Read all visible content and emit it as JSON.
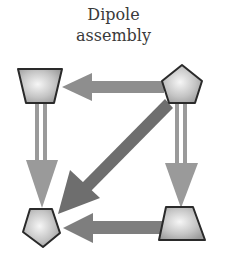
{
  "title": {
    "line1": "Dipole",
    "line2": "assembly"
  },
  "colors": {
    "arrow_light": "#9a9a9a",
    "arrow_dark": "#6e6e6e",
    "node_stroke": "#2a2a2a",
    "node_fill_center": "#f4f4f4",
    "node_fill_edge": "#9c9c9c"
  },
  "nodes": [
    {
      "id": "top-left",
      "shape": "trapezoid-inverted"
    },
    {
      "id": "top-right",
      "shape": "pentagon"
    },
    {
      "id": "bottom-left",
      "shape": "pentagon-inverted"
    },
    {
      "id": "bottom-right",
      "shape": "trapezoid"
    }
  ],
  "edges": [
    {
      "from": "top-right",
      "to": "top-left",
      "style": "solid-thick"
    },
    {
      "from": "top-right",
      "to": "bottom-left",
      "style": "solid-thick-dark"
    },
    {
      "from": "top-left",
      "to": "bottom-left",
      "style": "double-line"
    },
    {
      "from": "top-right",
      "to": "bottom-right",
      "style": "double-line"
    },
    {
      "from": "bottom-right",
      "to": "bottom-left",
      "style": "solid-thick"
    }
  ]
}
